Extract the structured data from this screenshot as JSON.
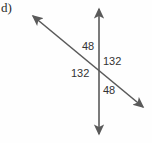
{
  "figure": {
    "part_label": "d)",
    "background_color": "#fefefe",
    "line_color": "#5a5a5a",
    "text_color": "#333333",
    "lines": [
      {
        "name": "vertical-transversal",
        "x1": 99,
        "y1": 4,
        "x2": 99,
        "y2": 139,
        "arrow_start": true,
        "arrow_end": true
      },
      {
        "name": "diagonal-transversal",
        "x1": 29,
        "y1": 13,
        "x2": 147,
        "y2": 111,
        "arrow_start": true,
        "arrow_end": true
      }
    ],
    "intersection": {
      "x": 99,
      "y": 70
    },
    "angle_labels": [
      {
        "name": "angle-top",
        "value": "48",
        "position": "upper-left-of-vertical"
      },
      {
        "name": "angle-right",
        "value": "132",
        "position": "right-of-vertical"
      },
      {
        "name": "angle-left",
        "value": "132",
        "position": "left-of-vertical"
      },
      {
        "name": "angle-bottom",
        "value": "48",
        "position": "lower-right-of-vertical"
      }
    ]
  }
}
